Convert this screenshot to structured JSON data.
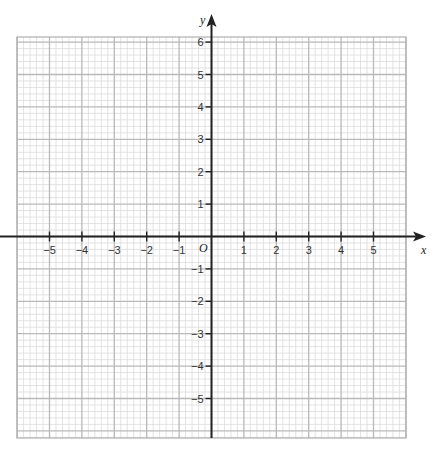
{
  "chart_data": {
    "type": "grid",
    "title": "",
    "xlabel": "x",
    "ylabel": "y",
    "origin_label": "O",
    "xlim": [
      -6,
      6
    ],
    "ylim": [
      -6,
      6
    ],
    "x_ticks": [
      -5,
      -4,
      -3,
      -2,
      -1,
      1,
      2,
      3,
      4,
      5
    ],
    "y_ticks": [
      6,
      5,
      4,
      3,
      2,
      1,
      -1,
      -2,
      -3,
      -4,
      -5
    ],
    "x_tick_labels": [
      "−5",
      "−4",
      "−3",
      "−2",
      "−1",
      "1",
      "2",
      "3",
      "4",
      "5"
    ],
    "y_tick_labels": [
      "6",
      "5",
      "4",
      "3",
      "2",
      "1",
      "−1",
      "−2",
      "−3",
      "−4",
      "−5"
    ],
    "minor_step": 0.2,
    "major_step": 1,
    "grid": true
  },
  "colors": {
    "axis": "#222222",
    "major_grid": "#b9b9b9",
    "minor_grid": "#dcdcdc",
    "border": "#b0b0b0"
  }
}
